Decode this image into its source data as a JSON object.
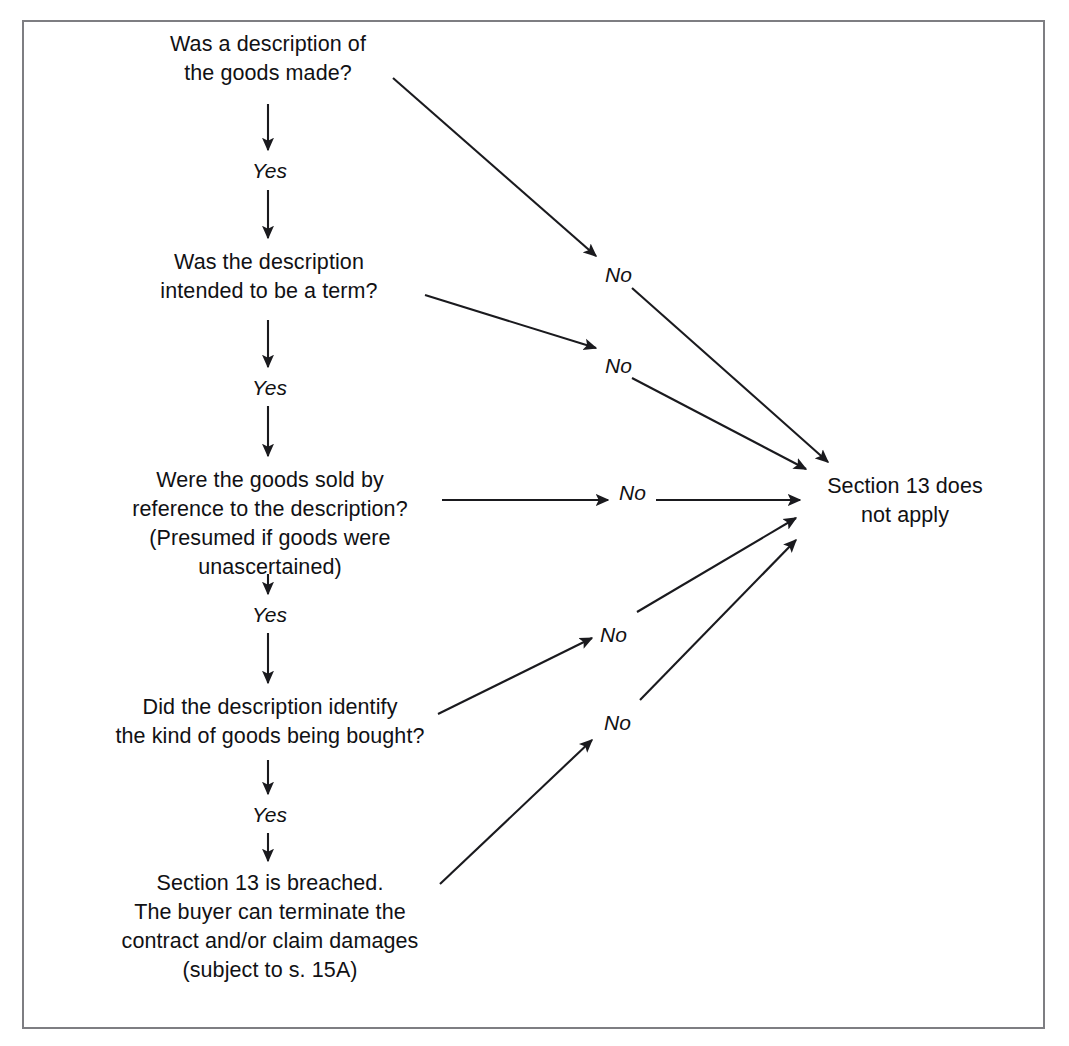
{
  "diagram": {
    "frame": {
      "border_color": "#7e7e82"
    },
    "nodes": [
      {
        "id": "q1",
        "name": "question-description-made",
        "text": "Was a description of\nthe goods made?"
      },
      {
        "id": "q2",
        "name": "question-description-term",
        "text": "Was the description\nintended to be a term?"
      },
      {
        "id": "q3",
        "name": "question-sold-by-reference",
        "text": "Were the goods sold by\nreference to the description?\n(Presumed if goods were\nunascertained)"
      },
      {
        "id": "q4",
        "name": "question-identify-kind",
        "text": "Did the description identify\nthe kind of goods being bought?"
      },
      {
        "id": "q5",
        "name": "outcome-breached",
        "text": "Section 13 is breached.\nThe buyer can terminate the\ncontract and/or claim damages\n(subject to s. 15A)"
      },
      {
        "id": "end",
        "name": "outcome-not-apply",
        "text": "Section 13 does\nnot apply"
      }
    ],
    "edges": [
      {
        "id": "yes1",
        "label": "Yes",
        "from": "q1",
        "to": "q2",
        "kind": "vertical"
      },
      {
        "id": "yes2",
        "label": "Yes",
        "from": "q2",
        "to": "q3",
        "kind": "vertical"
      },
      {
        "id": "yes3",
        "label": "Yes",
        "from": "q3",
        "to": "q4",
        "kind": "vertical"
      },
      {
        "id": "yes4",
        "label": "Yes",
        "from": "q4",
        "to": "q5",
        "kind": "vertical"
      },
      {
        "id": "no1",
        "label": "No",
        "from": "q1",
        "to": "end",
        "kind": "diagonal-down"
      },
      {
        "id": "no2",
        "label": "No",
        "from": "q2",
        "to": "end",
        "kind": "diagonal-down"
      },
      {
        "id": "no3",
        "label": "No",
        "from": "q3",
        "to": "end",
        "kind": "horizontal"
      },
      {
        "id": "no4",
        "label": "No",
        "from": "q4",
        "to": "end",
        "kind": "diagonal-up"
      },
      {
        "id": "no5",
        "label": "No",
        "from": "q5",
        "to": "end",
        "kind": "diagonal-up"
      }
    ]
  }
}
